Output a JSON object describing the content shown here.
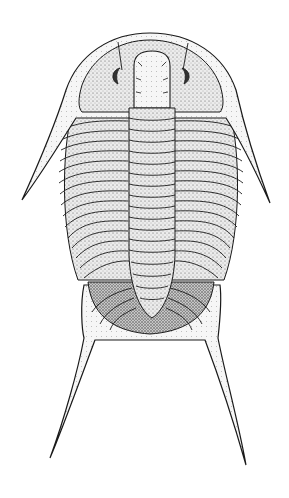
{
  "image": {
    "subject": "trilobite illustration",
    "style": "stippled pen-and-ink",
    "background": "#ffffff",
    "ink": "#1a1a1a",
    "shade_light": "#e6e6e6",
    "shade_mid": "#c4c4c4",
    "shade_dark": "#8e8e8e",
    "thoracic_segments": 17,
    "pygidial_ribs": 5
  }
}
